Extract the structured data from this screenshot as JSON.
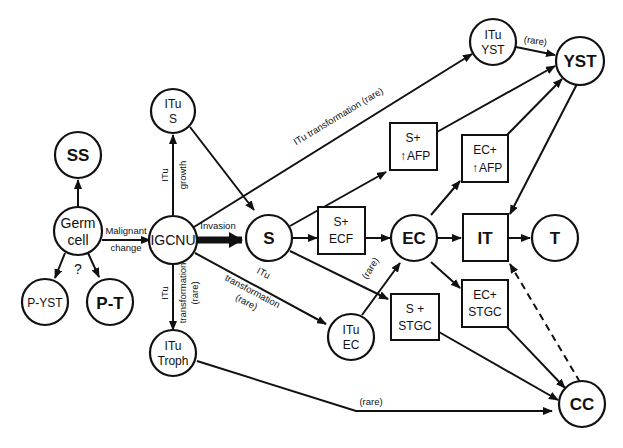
{
  "nodes": {
    "ss": {
      "l1": "SS"
    },
    "germ": {
      "l1": "Germ",
      "l2": "cell"
    },
    "pyst": {
      "l1": "P-YST"
    },
    "pt": {
      "l1": "P-T"
    },
    "question": {
      "l1": "?"
    },
    "igcnu": {
      "l1": "IGCNU"
    },
    "itu_s": {
      "l1": "ITu",
      "l2": "S"
    },
    "itu_troph": {
      "l1": "ITu",
      "l2": "Troph"
    },
    "s": {
      "l1": "S"
    },
    "s_ecf": {
      "l1": "S+",
      "l2": "ECF"
    },
    "s_afp": {
      "l1": "S+",
      "l2": "AFP",
      "arrow": "↑"
    },
    "s_stgc": {
      "l1": "S +",
      "l2": "STGC"
    },
    "itu_ec": {
      "l1": "ITu",
      "l2": "EC"
    },
    "ec": {
      "l1": "EC"
    },
    "ec_afp": {
      "l1": "EC+",
      "l2": "AFP",
      "arrow": "↑"
    },
    "ec_stgc": {
      "l1": "EC+",
      "l2": "STGC"
    },
    "it": {
      "l1": "IT"
    },
    "t": {
      "l1": "T"
    },
    "itu_yst": {
      "l1": "ITu",
      "l2": "YST"
    },
    "yst": {
      "l1": "YST"
    },
    "cc": {
      "l1": "CC"
    }
  },
  "edge_labels": {
    "malignant1": "Malignant",
    "malignant2": "change",
    "invasion": "Invasion",
    "itu_growth1": "ITu",
    "itu_growth2": "growth",
    "troph1": "ITu",
    "troph2": "transformation",
    "troph3": "(rare)",
    "ec_tr1": "ITu",
    "ec_tr2": "transformation",
    "ec_tr3": "(rare)",
    "yst_tr": "ITu transformation (rare)",
    "yst_rare": "(rare)",
    "ec_rare": "(rare)",
    "cc_rare": "(rare)"
  }
}
